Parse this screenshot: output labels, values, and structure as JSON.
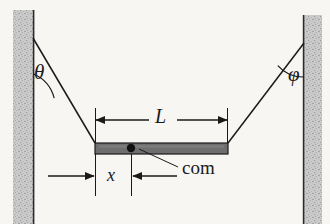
{
  "figure": {
    "kind": "free-body-diagram",
    "background_color": "#f7f6f3",
    "width": 330,
    "height": 224
  },
  "walls": {
    "fill_color": "#c9c9c9",
    "edge_color": "#2b2b2b",
    "left": {
      "name": "left-wall",
      "x": 13,
      "y": 10,
      "width": 21,
      "height": 214
    },
    "right": {
      "name": "right-wall",
      "x": 303,
      "y": 15,
      "width": 19,
      "height": 209
    }
  },
  "ropes": {
    "stroke_color": "#1a1a1a",
    "left": {
      "name": "left-rope",
      "x1": 33,
      "y1": 38,
      "x2": 95,
      "y2": 143
    },
    "right": {
      "name": "right-rope",
      "x1": 304,
      "y1": 43,
      "x2": 228,
      "y2": 143
    }
  },
  "beam": {
    "name": "beam",
    "x": 95,
    "y": 143,
    "width": 133,
    "height": 11,
    "fill_color": "#6e6e6e",
    "edge_color": "#1a1a1a"
  },
  "com": {
    "name": "center-of-mass",
    "label": "com",
    "dot_x": 131,
    "dot_y": 148,
    "dot_radius": 4.2,
    "dot_color": "#111111",
    "leader_x1": 139,
    "leader_y1": 149,
    "leader_x2": 178,
    "leader_y2": 167
  },
  "angles": {
    "theta": {
      "name": "angle-theta",
      "label": "θ",
      "vertex_x": 33,
      "vertex_y": 38,
      "arc_radius": 36
    },
    "phi": {
      "name": "angle-phi",
      "label": "φ",
      "vertex_x": 304,
      "vertex_y": 43,
      "arc_radius": 34
    }
  },
  "dimensions": {
    "length": {
      "name": "dimension-L",
      "label": "L",
      "arrow_y": 120,
      "x_left": 95,
      "x_right": 228,
      "ext_top": 108,
      "ext_bottom": 144
    },
    "offset": {
      "name": "dimension-x",
      "label": "x",
      "arrow_y": 176,
      "x_left": 95,
      "x_right": 131,
      "left_arrow_tail": 48,
      "right_arrow_tail": 177,
      "ext_top": 154,
      "ext_bottom": 196
    }
  }
}
